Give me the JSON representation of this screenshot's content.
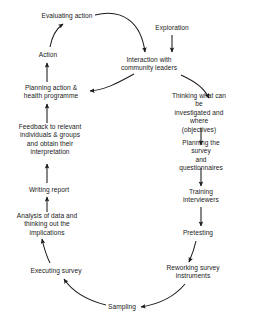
{
  "diagram": {
    "type": "cyclical-flowchart",
    "background_color": "#ffffff",
    "text_color": "#1a1a1a",
    "stroke_color": "#1a1a1a",
    "nodes": [
      {
        "id": "evaluating_action",
        "label": "Evaluating action",
        "x": 67,
        "y": 16
      },
      {
        "id": "exploration",
        "label": "Exploration",
        "x": 172,
        "y": 28
      },
      {
        "id": "action",
        "label": "Action",
        "x": 48,
        "y": 55
      },
      {
        "id": "interaction",
        "label": "Interaction with\ncommunity leaders",
        "x": 149,
        "y": 64
      },
      {
        "id": "planning_action",
        "label": "Planning action &\nhealth programme",
        "x": 51,
        "y": 92
      },
      {
        "id": "thinking",
        "label": "Thinking what can be\ninvestigated and where\n(objectives)",
        "x": 199,
        "y": 113
      },
      {
        "id": "planning_survey",
        "label": "Planning the survey\nand questionnaires",
        "x": 201,
        "y": 156
      },
      {
        "id": "feedback",
        "label": "Feedback to relevant\nindividuals & groups\nand obtain their\ninterpretation",
        "x": 50,
        "y": 140
      },
      {
        "id": "training",
        "label": "Training\ninterviewers",
        "x": 201,
        "y": 196
      },
      {
        "id": "writing_report",
        "label": "Writing report",
        "x": 49,
        "y": 190
      },
      {
        "id": "pretesting",
        "label": "Pretesting",
        "x": 198,
        "y": 233
      },
      {
        "id": "analysis",
        "label": "Analysis of data and\nthinking out the\nimplications",
        "x": 47,
        "y": 225
      },
      {
        "id": "reworking",
        "label": "Reworking survey\ninstruments",
        "x": 193,
        "y": 272
      },
      {
        "id": "executing_survey",
        "label": "Executing survey",
        "x": 56,
        "y": 271
      },
      {
        "id": "sampling",
        "label": "Sampling",
        "x": 122,
        "y": 307
      }
    ],
    "edges": [
      {
        "from": "evaluating_action",
        "to": "interaction",
        "style": "curved"
      },
      {
        "from": "exploration",
        "to": "interaction",
        "style": "straight"
      },
      {
        "from": "interaction",
        "to": "thinking",
        "style": "curved"
      },
      {
        "from": "thinking",
        "to": "planning_survey",
        "style": "straight"
      },
      {
        "from": "planning_survey",
        "to": "training",
        "style": "straight"
      },
      {
        "from": "training",
        "to": "pretesting",
        "style": "straight"
      },
      {
        "from": "pretesting",
        "to": "reworking",
        "style": "curved"
      },
      {
        "from": "reworking",
        "to": "sampling",
        "style": "curved"
      },
      {
        "from": "sampling",
        "to": "executing_survey",
        "style": "curved"
      },
      {
        "from": "executing_survey",
        "to": "analysis",
        "style": "curved"
      },
      {
        "from": "analysis",
        "to": "writing_report",
        "style": "straight"
      },
      {
        "from": "writing_report",
        "to": "feedback",
        "style": "straight"
      },
      {
        "from": "feedback",
        "to": "planning_action",
        "style": "straight"
      },
      {
        "from": "interaction",
        "to": "planning_action",
        "style": "curved"
      },
      {
        "from": "planning_action",
        "to": "action",
        "style": "straight"
      },
      {
        "from": "action",
        "to": "evaluating_action",
        "style": "curved"
      }
    ]
  }
}
